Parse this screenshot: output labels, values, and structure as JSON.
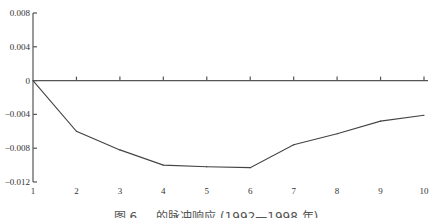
{
  "chart_data": {
    "type": "line",
    "title": "",
    "caption": "图 6 ... 的脉冲响应 (1992—1998 年)",
    "xlabel": "",
    "ylabel": "",
    "x": [
      1,
      2,
      3,
      4,
      5,
      6,
      7,
      8,
      9,
      10
    ],
    "series": [
      {
        "name": "impulse response",
        "values": [
          0,
          -0.006,
          -0.0082,
          -0.01,
          -0.0102,
          -0.0103,
          -0.0076,
          -0.0063,
          -0.0048,
          -0.0041
        ]
      }
    ],
    "xticks": [
      "1",
      "2",
      "3",
      "4",
      "5",
      "6",
      "7",
      "8",
      "9",
      "10"
    ],
    "yticks": [
      "0.008",
      "0.004",
      "0",
      "-0.004",
      "-0.008",
      "-0.012"
    ],
    "ytick_values": [
      0.008,
      0.004,
      0,
      -0.004,
      -0.008,
      -0.012
    ],
    "xlim": [
      1,
      10
    ],
    "ylim": [
      -0.012,
      0.008
    ],
    "grid": false,
    "legend": "none"
  }
}
